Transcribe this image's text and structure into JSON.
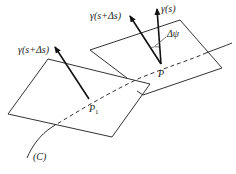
{
  "diagram": {
    "labels": {
      "gamma_s": "γ(s)",
      "gamma_s_ds_at_P": "γ(s+Δs)",
      "gamma_s_ds_at_P1": "γ(s+Δs)",
      "delta_psi": "Δψ",
      "point_P": "P",
      "point_P1": "P",
      "point_P1_subscript": "1",
      "curve_C": "(C)"
    },
    "colors": {
      "ink": "#222222",
      "background": "#ffffff"
    }
  }
}
